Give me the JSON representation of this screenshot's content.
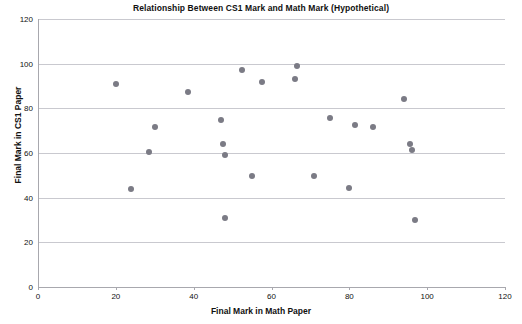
{
  "chart_data": {
    "type": "scatter",
    "title": "Relationship Between CS1 Mark and Math Mark (Hypothetical)",
    "xlabel": "Final Mark in Math Paper",
    "ylabel": "Final Mark in CS1 Paper",
    "xlim": [
      0,
      120
    ],
    "ylim": [
      0,
      120
    ],
    "xticks": [
      0,
      20,
      40,
      60,
      80,
      100,
      120
    ],
    "yticks": [
      0,
      20,
      40,
      60,
      80,
      100,
      120
    ],
    "grid": "horizontal",
    "legend": null,
    "marker_color": "#7b7b85",
    "points": [
      {
        "x": 20,
        "y": 91
      },
      {
        "x": 24,
        "y": 44
      },
      {
        "x": 28.5,
        "y": 60.5
      },
      {
        "x": 30,
        "y": 71.5
      },
      {
        "x": 38.5,
        "y": 87.5
      },
      {
        "x": 47,
        "y": 75
      },
      {
        "x": 47.5,
        "y": 64
      },
      {
        "x": 48,
        "y": 59
      },
      {
        "x": 48,
        "y": 31
      },
      {
        "x": 52.5,
        "y": 97
      },
      {
        "x": 55,
        "y": 49.5
      },
      {
        "x": 57.5,
        "y": 92
      },
      {
        "x": 66,
        "y": 93
      },
      {
        "x": 66.5,
        "y": 99
      },
      {
        "x": 71,
        "y": 49.5
      },
      {
        "x": 75,
        "y": 75.5
      },
      {
        "x": 80,
        "y": 44.5
      },
      {
        "x": 81.5,
        "y": 72.5
      },
      {
        "x": 86,
        "y": 71.5
      },
      {
        "x": 94,
        "y": 84
      },
      {
        "x": 95.5,
        "y": 64
      },
      {
        "x": 96,
        "y": 61.5
      },
      {
        "x": 97,
        "y": 30
      }
    ]
  }
}
